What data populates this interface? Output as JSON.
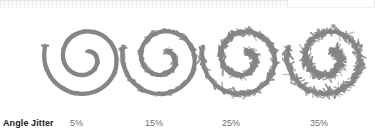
{
  "figure": {
    "parameter_label": "Angle Jitter",
    "background_color": "#ffffff",
    "stroke_color": "#858585",
    "label_color": "#1a1a1a",
    "value_color": "#6e6e6e"
  },
  "chrome": {
    "present": true,
    "description": "cropped-toolbar-sliver"
  },
  "chart_data": {
    "type": "table",
    "title": "Angle Jitter",
    "xlabel": "Angle Jitter",
    "ylabel": "",
    "categories": [
      "5%",
      "15%",
      "25%",
      "35%"
    ],
    "values": [
      5,
      15,
      25,
      35
    ],
    "series": [
      {
        "name": "Angle Jitter",
        "values": [
          5,
          15,
          25,
          35
        ]
      }
    ],
    "legend": "none",
    "grid": false,
    "annotations": [
      "Spiral brush stroke sample rendered at each Angle Jitter percentage",
      "Jitter roughness increases left to right"
    ]
  },
  "samples": [
    {
      "id": "sample-1",
      "value_label": "5%",
      "jitter_percent": 5,
      "center_x": 85,
      "label_x": 70,
      "spike_amplitude": 1.6,
      "spike_count": 150,
      "seed": 11
    },
    {
      "id": "sample-2",
      "value_label": "15%",
      "jitter_percent": 15,
      "center_x": 163,
      "label_x": 145,
      "spike_amplitude": 3.2,
      "spike_count": 170,
      "seed": 27
    },
    {
      "id": "sample-3",
      "value_label": "25%",
      "jitter_percent": 25,
      "center_x": 243,
      "label_x": 222,
      "spike_amplitude": 4.6,
      "spike_count": 190,
      "seed": 43
    },
    {
      "id": "sample-4",
      "value_label": "35%",
      "jitter_percent": 35,
      "center_x": 328,
      "label_x": 310,
      "spike_amplitude": 6.2,
      "spike_count": 215,
      "seed": 59
    }
  ]
}
